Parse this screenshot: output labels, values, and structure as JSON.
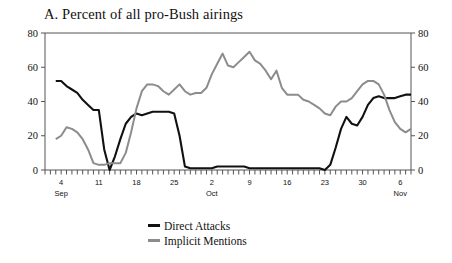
{
  "chart_data": {
    "type": "line",
    "title": "A. Percent of all pro-Bush airings",
    "xlabel": "",
    "ylabel": "",
    "ylim": [
      0,
      80
    ],
    "yticks": [
      0,
      20,
      40,
      60,
      80
    ],
    "right_axis": true,
    "right_yticks": [
      0,
      20,
      40,
      60,
      80
    ],
    "grid": false,
    "legend_position": "bottom-center",
    "x_tick_labels": [
      {
        "day_index": 3,
        "label": "4",
        "month": "Sep"
      },
      {
        "day_index": 10,
        "label": "11",
        "month": ""
      },
      {
        "day_index": 17,
        "label": "18",
        "month": ""
      },
      {
        "day_index": 24,
        "label": "25",
        "month": ""
      },
      {
        "day_index": 31,
        "label": "2",
        "month": "Oct"
      },
      {
        "day_index": 38,
        "label": "9",
        "month": ""
      },
      {
        "day_index": 45,
        "label": "16",
        "month": ""
      },
      {
        "day_index": 52,
        "label": "23",
        "month": ""
      },
      {
        "day_index": 59,
        "label": "30",
        "month": ""
      },
      {
        "day_index": 66,
        "label": "6",
        "month": "Nov"
      }
    ],
    "x_first_date": "Sep 1",
    "x_last_date": "Nov 8",
    "n_points": 69,
    "series": [
      {
        "name": "Direct Attacks",
        "color": "#111111",
        "values": [
          null,
          null,
          52,
          52,
          49,
          47,
          45,
          41,
          38,
          35,
          35,
          12,
          0,
          8,
          18,
          27,
          31,
          33,
          32,
          33,
          34,
          34,
          34,
          34,
          33,
          20,
          2,
          1,
          1,
          1,
          1,
          1,
          2,
          2,
          2,
          2,
          2,
          2,
          1,
          1,
          1,
          1,
          1,
          1,
          1,
          1,
          1,
          1,
          1,
          1,
          1,
          1,
          0,
          3,
          13,
          24,
          31,
          27,
          26,
          31,
          38,
          42,
          43,
          42,
          42,
          42,
          43,
          44,
          44
        ]
      },
      {
        "name": "Implicit Mentions",
        "color": "#8c8c8c",
        "values": [
          null,
          null,
          18,
          20,
          25,
          24,
          22,
          18,
          12,
          4,
          3,
          3,
          4,
          4,
          4,
          10,
          22,
          36,
          46,
          50,
          50,
          49,
          46,
          44,
          47,
          50,
          46,
          44,
          45,
          45,
          48,
          56,
          62,
          68,
          61,
          60,
          63,
          66,
          69,
          64,
          62,
          58,
          53,
          58,
          48,
          44,
          44,
          44,
          41,
          40,
          38,
          36,
          33,
          32,
          37,
          40,
          40,
          42,
          46,
          50,
          52,
          52,
          50,
          44,
          35,
          28,
          24,
          22,
          24
        ]
      }
    ]
  },
  "legend": {
    "items": [
      {
        "label": "Direct Attacks",
        "color": "#111111"
      },
      {
        "label": "Implicit Mentions",
        "color": "#8c8c8c"
      }
    ]
  }
}
